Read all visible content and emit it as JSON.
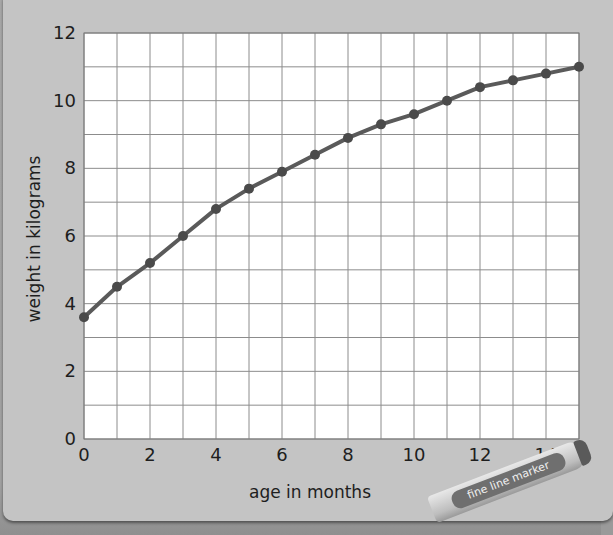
{
  "chart_data": {
    "type": "line",
    "title": "",
    "xlabel": "age in months",
    "ylabel": "weight in kilograms",
    "x": [
      0,
      1,
      2,
      3,
      4,
      5,
      6,
      7,
      8,
      9,
      10,
      11,
      12,
      13,
      14,
      15
    ],
    "series": [
      {
        "name": "weight",
        "values": [
          3.6,
          4.5,
          5.2,
          6.0,
          6.8,
          7.4,
          7.9,
          8.4,
          8.9,
          9.3,
          9.6,
          10.0,
          10.4,
          10.6,
          10.8,
          11.0
        ]
      }
    ],
    "xlim": [
      0,
      15
    ],
    "ylim": [
      0,
      12
    ],
    "xticks": [
      "0",
      "2",
      "4",
      "6",
      "8",
      "10",
      "12",
      "14"
    ],
    "xtick_values": [
      0,
      2,
      4,
      6,
      8,
      10,
      12,
      14
    ],
    "yticks": [
      "0",
      "2",
      "4",
      "6",
      "8",
      "10",
      "12"
    ],
    "ytick_values": [
      0,
      2,
      4,
      6,
      8,
      10,
      12
    ],
    "grid": true,
    "grid_step_x": 1,
    "grid_step_y": 1,
    "legend": null,
    "line_color": "#5a5a5a",
    "marker_color": "#4a4a4a"
  },
  "decoration": {
    "marker_pen_label": "fine line marker"
  }
}
